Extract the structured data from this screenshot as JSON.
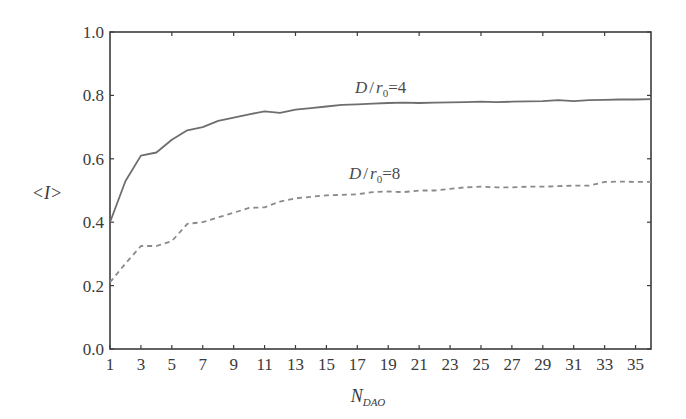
{
  "chart_data": {
    "type": "line",
    "title": "",
    "xlabel": "N_DAO",
    "xlabel_main": "N",
    "xlabel_sub": "DAO",
    "ylabel": "<I>",
    "xlim": [
      1,
      36
    ],
    "ylim": [
      0.0,
      1.0
    ],
    "grid": false,
    "legend_position": "inline labels",
    "x_ticks": [
      1,
      3,
      5,
      7,
      9,
      11,
      13,
      15,
      17,
      19,
      21,
      23,
      25,
      27,
      29,
      31,
      33,
      35
    ],
    "y_ticks": [
      "0.0",
      "0.2",
      "0.4",
      "0.6",
      "0.8",
      "1.0"
    ],
    "x": [
      1,
      2,
      3,
      4,
      5,
      6,
      7,
      8,
      9,
      10,
      11,
      12,
      13,
      14,
      15,
      16,
      17,
      18,
      19,
      20,
      21,
      22,
      23,
      24,
      25,
      26,
      27,
      28,
      29,
      30,
      31,
      32,
      33,
      34,
      35,
      36
    ],
    "series": [
      {
        "name": "D/r0=4",
        "style": "solid",
        "color": "#6e6e6e",
        "values": [
          0.4,
          0.53,
          0.61,
          0.62,
          0.66,
          0.69,
          0.7,
          0.72,
          0.73,
          0.74,
          0.75,
          0.745,
          0.755,
          0.76,
          0.765,
          0.77,
          0.772,
          0.774,
          0.776,
          0.777,
          0.776,
          0.777,
          0.778,
          0.779,
          0.78,
          0.779,
          0.78,
          0.781,
          0.782,
          0.785,
          0.782,
          0.785,
          0.786,
          0.787,
          0.787,
          0.788
        ]
      },
      {
        "name": "D/r0=8",
        "style": "dashed",
        "color": "#8a8a8a",
        "values": [
          0.21,
          0.27,
          0.325,
          0.325,
          0.34,
          0.395,
          0.4,
          0.415,
          0.43,
          0.445,
          0.447,
          0.465,
          0.475,
          0.48,
          0.485,
          0.486,
          0.488,
          0.495,
          0.497,
          0.495,
          0.5,
          0.5,
          0.505,
          0.51,
          0.512,
          0.51,
          0.51,
          0.512,
          0.512,
          0.514,
          0.515,
          0.515,
          0.527,
          0.528,
          0.527,
          0.527
        ]
      }
    ],
    "annotations": [
      {
        "text_main": "D",
        "text_slash": "/",
        "text_r": "r",
        "text_sub": "0",
        "text_eq": "=4",
        "near_series": "D/r0=4"
      },
      {
        "text_main": "D",
        "text_slash": "/",
        "text_r": "r",
        "text_sub": "0",
        "text_eq": "=8",
        "near_series": "D/r0=8"
      }
    ]
  }
}
